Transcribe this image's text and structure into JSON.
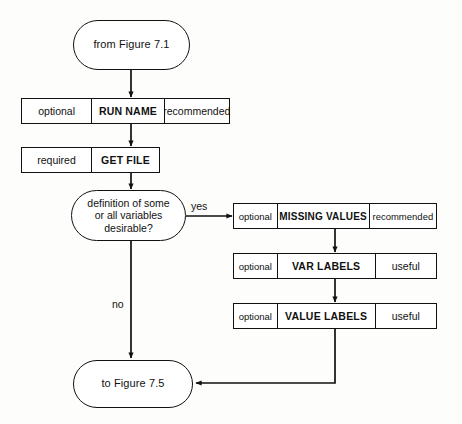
{
  "figure": {
    "type": "flowchart",
    "orientation": "top-to-bottom",
    "background_color": "#fdfdfc",
    "line_color": "#111111"
  },
  "nodes": {
    "entry_terminal": {
      "label": "from Figure 7.1",
      "shape": "stadium"
    },
    "exit_terminal": {
      "label": "to Figure 7.5",
      "shape": "stadium"
    },
    "decision": {
      "shape": "stadium",
      "line1": "definition of some",
      "line2": "or all variables",
      "line3": "desirable?"
    }
  },
  "steps": [
    {
      "requirement": "optional",
      "command": "RUN NAME",
      "note": "recommended"
    },
    {
      "requirement": "required",
      "command": "GET FILE",
      "note": ""
    },
    {
      "requirement": "optional",
      "command": "MISSING VALUES",
      "note": "recommended"
    },
    {
      "requirement": "optional",
      "command": "VAR LABELS",
      "note": "useful"
    },
    {
      "requirement": "optional",
      "command": "VALUE LABELS",
      "note": "useful"
    }
  ],
  "edge_labels": {
    "yes": "yes",
    "no": "no"
  }
}
